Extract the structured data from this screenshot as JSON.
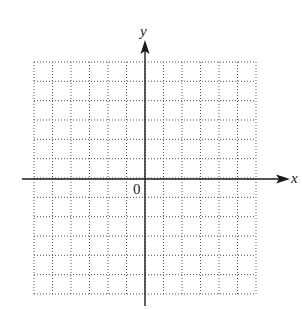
{
  "diagram": {
    "type": "coordinate-plane",
    "x_axis_label": "x",
    "y_axis_label": "y",
    "origin_label": "0",
    "grid": {
      "columns": 12,
      "rows": 12,
      "x_range": [
        -6,
        6
      ],
      "y_range": [
        -6,
        6
      ],
      "line_style": "dotted"
    },
    "colors": {
      "axis": "#1a1a1a",
      "grid": "#555555",
      "background": "#ffffff"
    }
  }
}
